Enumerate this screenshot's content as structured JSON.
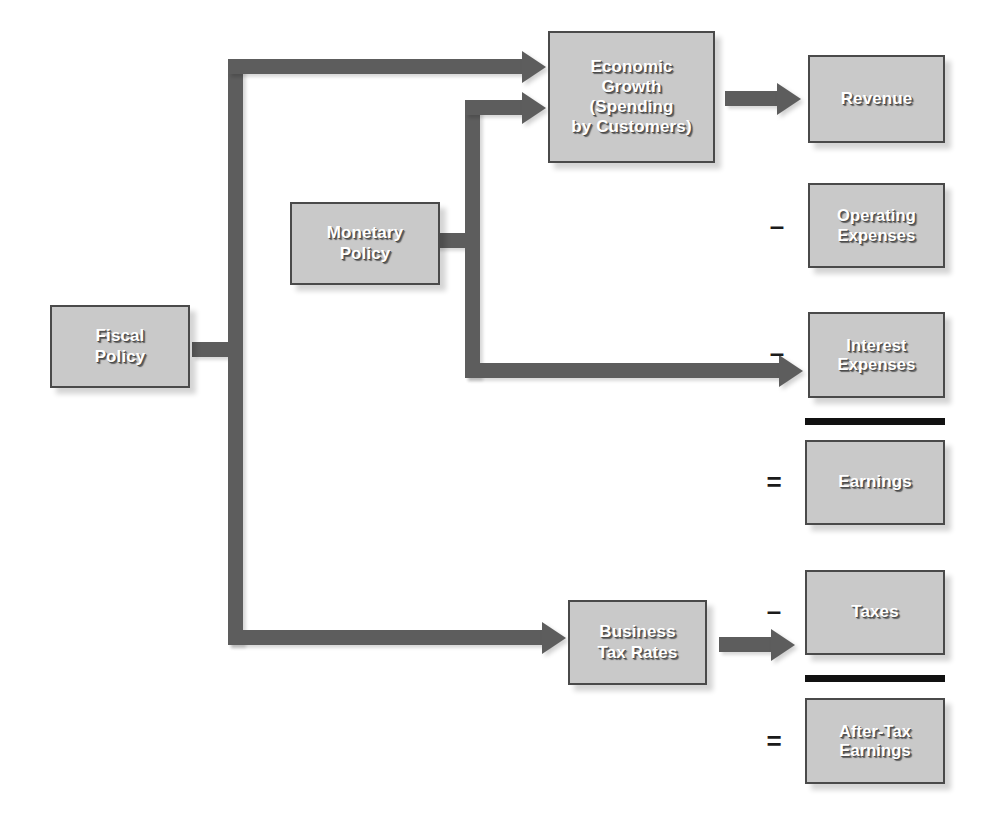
{
  "diagram": {
    "background_color": "#ffffff",
    "node_fill_color": "#c9c9c9",
    "node_border_color": "#4a4a4a",
    "connector_color": "#5d5d5d",
    "rule_color": "#111111",
    "label_color": "#ffffff"
  },
  "nodes": [
    {
      "id": "fiscal-policy",
      "label": "Fiscal\nPolicy"
    },
    {
      "id": "monetary-policy",
      "label": "Monetary\nPolicy"
    },
    {
      "id": "economic-growth",
      "label": "Economic\nGrowth\n(Spending\nby Customers)"
    },
    {
      "id": "business-tax-rates",
      "label": "Business\nTax Rates"
    },
    {
      "id": "revenue",
      "label": "Revenue"
    },
    {
      "id": "operating-expenses",
      "label": "Operating\nExpenses"
    },
    {
      "id": "interest-expenses",
      "label": "Interest\nExpenses"
    },
    {
      "id": "earnings",
      "label": "Earnings"
    },
    {
      "id": "taxes",
      "label": "Taxes"
    },
    {
      "id": "after-tax-earnings",
      "label": "After-Tax\nEarnings"
    }
  ],
  "operators": [
    {
      "id": "minus-operating-expenses",
      "symbol": "–"
    },
    {
      "id": "minus-interest-expenses",
      "symbol": "–"
    },
    {
      "id": "equals-earnings",
      "symbol": "="
    },
    {
      "id": "minus-taxes",
      "symbol": "–"
    },
    {
      "id": "equals-after-tax-earnings",
      "symbol": "="
    }
  ],
  "connections": [
    {
      "id": "fiscal-to-economic-growth",
      "from": "fiscal-policy",
      "to": "economic-growth"
    },
    {
      "id": "fiscal-to-business-tax-rates",
      "from": "fiscal-policy",
      "to": "business-tax-rates"
    },
    {
      "id": "monetary-to-economic-growth",
      "from": "monetary-policy",
      "to": "economic-growth"
    },
    {
      "id": "monetary-to-interest-expenses",
      "from": "monetary-policy",
      "to": "interest-expenses"
    },
    {
      "id": "economic-growth-to-revenue",
      "from": "economic-growth",
      "to": "revenue"
    },
    {
      "id": "business-tax-rates-to-taxes",
      "from": "business-tax-rates",
      "to": "taxes"
    }
  ]
}
